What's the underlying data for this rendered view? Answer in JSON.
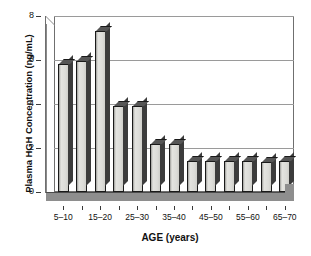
{
  "chart_data": {
    "type": "bar",
    "title": "",
    "xlabel": "AGE (years)",
    "ylabel": "Plasma HGH Concentration (ng/mL)",
    "ylim": [
      0,
      8
    ],
    "yticks": [
      0,
      2,
      4,
      6,
      8
    ],
    "ytick_labels": [
      "0",
      "2",
      "4",
      "6",
      "8"
    ],
    "grid": true,
    "grid_axis": "y",
    "legend": "none",
    "style": "3d-bar",
    "bar_fill_color": "#dcdcd8",
    "bar_edge_color": "#1a1a1a",
    "floor_color": "#8e8e8e",
    "categories": [
      "5-10",
      "10-15",
      "15-20",
      "20-25",
      "25-30",
      "30-35",
      "35-40",
      "40-45",
      "45-50",
      "50-55",
      "55-60",
      "60-65",
      "65-70"
    ],
    "values": [
      5.8,
      5.95,
      7.3,
      3.9,
      3.9,
      2.2,
      2.2,
      1.4,
      1.4,
      1.4,
      1.4,
      1.35,
      1.4
    ],
    "visible_xtick_labels": [
      {
        "category": "5-10",
        "label": "5–10",
        "index": 0
      },
      {
        "category": "15-20",
        "label": "15–20",
        "index": 2
      },
      {
        "category": "25-30",
        "label": "25–30",
        "index": 4
      },
      {
        "category": "35-40",
        "label": "35–40",
        "index": 6
      },
      {
        "category": "45-50",
        "label": "45–50",
        "index": 8
      },
      {
        "category": "55-60",
        "label": "55–60",
        "index": 10
      },
      {
        "category": "65-70",
        "label": "65–70",
        "index": 12
      }
    ]
  }
}
